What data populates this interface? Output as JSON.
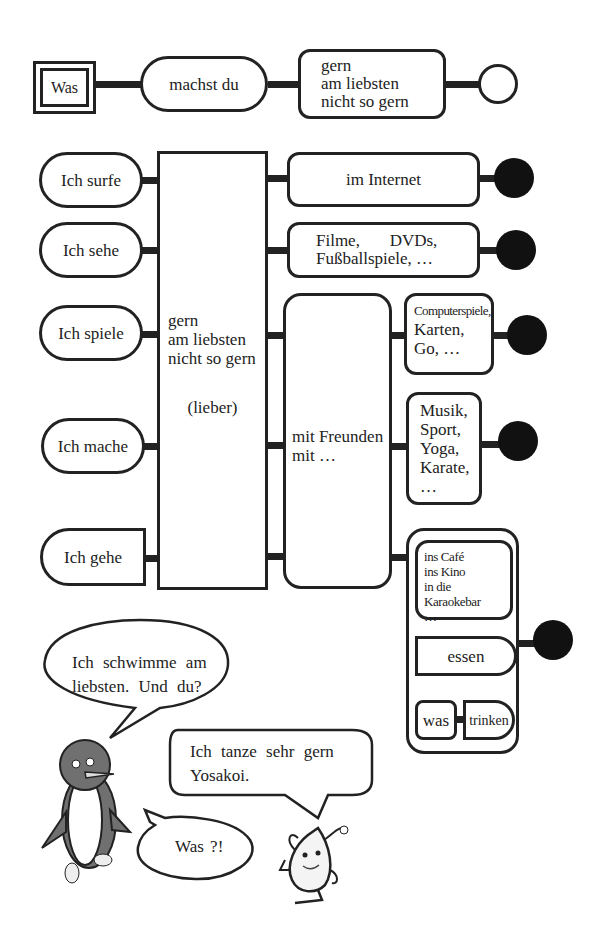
{
  "header_row": {
    "was": "Was",
    "machst_du": "machst du",
    "adverbs": "gern\nam liebsten\nnicht so gern"
  },
  "verbs": [
    {
      "label": "Ich surfe"
    },
    {
      "label": "Ich sehe"
    },
    {
      "label": "Ich spiele"
    },
    {
      "label": "Ich mache"
    },
    {
      "label": "Ich gehe"
    }
  ],
  "center_box": {
    "adverbs": "gern\nam liebsten\nnicht so gern",
    "comparative": "(lieber)"
  },
  "with_friends": "mit Freunden\nmit …",
  "objects": {
    "internet": "im Internet",
    "media": "Filme,       DVDs,\nFußballspiele, …",
    "games_small": "Computerspiele,",
    "games": "Karten,\nGo, …",
    "activities": "Musik,\nSport,\nYoga,\nKarate,\n…",
    "places": "ins Café\nins Kino\nin die Karaokebar\n…",
    "essen": "essen",
    "was": "was",
    "trinken": "trinken"
  },
  "dialogue": {
    "penguin": "Ich schwimme am\nliebsten. Und du?",
    "mascot": "Ich tanze sehr gern\nYosakoi.",
    "penguin_reply": "Was ?!"
  },
  "colors": {
    "line": "#222222",
    "penguin_body": "#707070",
    "dot": "#111111"
  }
}
